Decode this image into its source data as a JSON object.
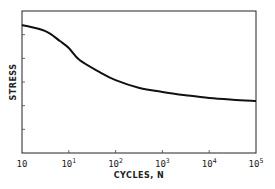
{
  "chart_data": {
    "type": "line",
    "title": "",
    "xlabel": "CYCLES, N",
    "ylabel": "STRESS",
    "x_scale": "log",
    "x_tick_labels": [
      {
        "base": "10",
        "exp": ""
      },
      {
        "base": "10",
        "exp": "1"
      },
      {
        "base": "10",
        "exp": "2"
      },
      {
        "base": "10",
        "exp": "3"
      },
      {
        "base": "10",
        "exp": "4"
      },
      {
        "base": "10",
        "exp": "5"
      }
    ],
    "x_tick_positions_log_units": [
      1,
      2,
      3,
      4,
      5,
      6
    ],
    "xlim_log_units": [
      1,
      6
    ],
    "y_ticks_unlabeled": [
      1,
      2,
      3,
      4,
      5
    ],
    "ylim": [
      0,
      6
    ],
    "grid": false,
    "legend": "none",
    "series": [
      {
        "name": "S-N curve",
        "color": "#111111",
        "x_log_units": [
          1.0,
          1.5,
          1.81,
          2.0,
          2.23,
          2.66,
          3.0,
          3.51,
          4.0,
          4.5,
          5.0,
          5.5,
          6.0
        ],
        "values": [
          5.41,
          5.15,
          4.73,
          4.44,
          3.93,
          3.42,
          3.08,
          2.75,
          2.58,
          2.44,
          2.32,
          2.25,
          2.2
        ]
      }
    ]
  }
}
